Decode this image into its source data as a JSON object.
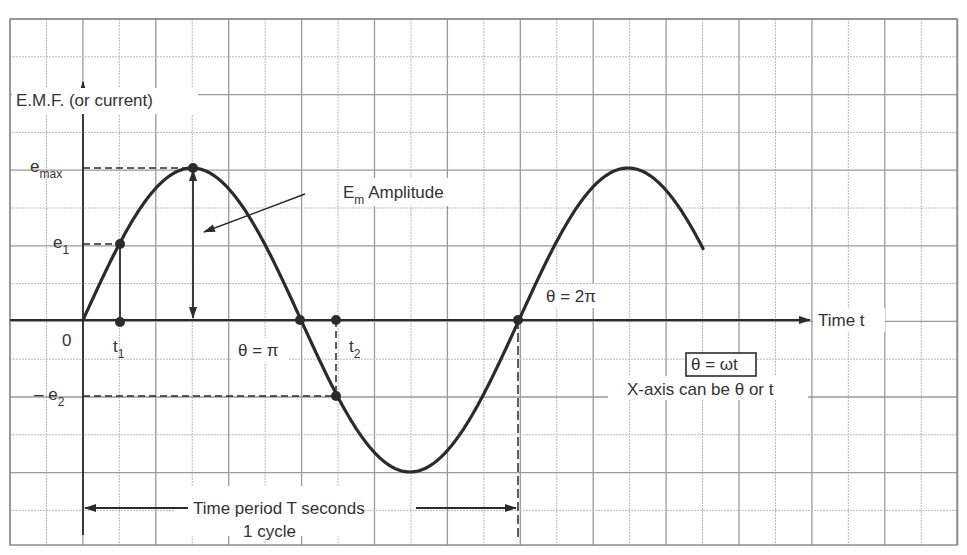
{
  "diagram": {
    "colors": {
      "grid_major": "#9a9a9a",
      "grid_minor": "#b8b8b8",
      "curve": "#2b2b2b",
      "text": "#333333",
      "border": "#8c8c8c"
    },
    "y_axis_label": "E.M.F. (or current)",
    "x_axis_label": "Time t",
    "origin_label": "0",
    "labels": {
      "e_max": {
        "base": "e",
        "sub": "max"
      },
      "e1": {
        "base": "e",
        "sub": "1"
      },
      "neg_e2": {
        "base": "– e",
        "sub": "2"
      },
      "t1": {
        "base": "t",
        "sub": "1"
      },
      "t2": {
        "base": "t",
        "sub": "2"
      },
      "amplitude": {
        "base": "E",
        "sub": "m",
        "rest": " Amplitude"
      },
      "theta_pi": "θ = π",
      "theta_2pi": "θ = 2π",
      "omega_box": "θ = ωt",
      "x_axis_note": "X-axis can be θ or t",
      "period_line1": "Time period T seconds",
      "period_line2": "1 cycle"
    },
    "geometry": {
      "origin": [
        83,
        320
      ],
      "half_period_px": 218,
      "amplitude_px": 152,
      "curve_end_x": 703
    },
    "marked_points": [
      {
        "name": "e1-point",
        "x": 120,
        "y": 244
      },
      {
        "name": "t1-point",
        "x": 120,
        "y": 322
      },
      {
        "name": "emax-point",
        "x": 193,
        "y": 168
      },
      {
        "name": "theta-pi-point",
        "x": 300,
        "y": 320
      },
      {
        "name": "t2-point",
        "x": 336,
        "y": 320
      },
      {
        "name": "neg-e2-point",
        "x": 336,
        "y": 396
      },
      {
        "name": "theta-2pi-point",
        "x": 518,
        "y": 320
      }
    ]
  }
}
